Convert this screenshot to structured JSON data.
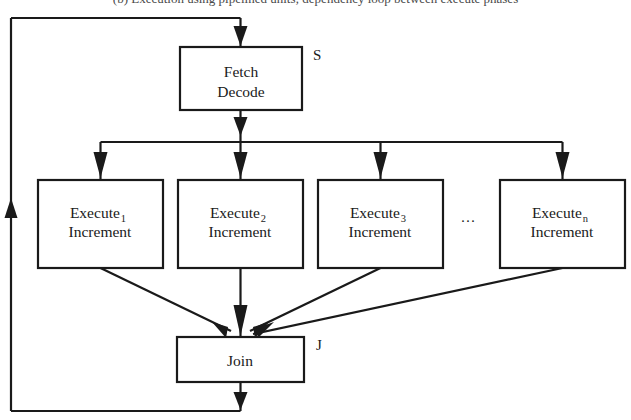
{
  "figure": {
    "caption_partial": "(b) Execution using pipelined units; dependency loop between execute phases",
    "background_color": "#ffffff",
    "line_color": "#1a1a1a",
    "width": 631,
    "height": 420
  },
  "nodes": {
    "fetch_decode": {
      "line1": "Fetch",
      "line2": "Decode",
      "tag": "S",
      "x": 180,
      "y": 47,
      "w": 122,
      "h": 63
    },
    "join": {
      "label": "Join",
      "tag": "J",
      "x": 177,
      "y": 337,
      "w": 127,
      "h": 45
    },
    "execute": [
      {
        "name": "Execute",
        "subscript": "1",
        "line2": "Increment",
        "x": 38,
        "y": 180,
        "w": 125,
        "h": 88
      },
      {
        "name": "Execute",
        "subscript": "2",
        "line2": "Increment",
        "x": 178,
        "y": 180,
        "w": 125,
        "h": 88
      },
      {
        "name": "Execute",
        "subscript": "3",
        "line2": "Increment",
        "x": 318,
        "y": 180,
        "w": 125,
        "h": 88
      },
      {
        "name": "Execute",
        "subscript": "n",
        "line2": "Increment",
        "x": 500,
        "y": 180,
        "w": 125,
        "h": 88
      }
    ],
    "ellipsis": {
      "glyph": "···",
      "x": 468,
      "y": 222
    }
  },
  "edges": {
    "loop_label": "feedback-loop",
    "fork_bar_y": 142,
    "feedback_top_y": 18,
    "feedback_left_x": 11,
    "feedback_bottom_y": 411
  }
}
